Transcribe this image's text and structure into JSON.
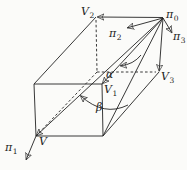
{
  "figure": {
    "type": "geometry-diagram",
    "background_color": "#fbfbf9",
    "stroke_color": "#222222",
    "labels": {
      "pi0": {
        "base": "π",
        "sub": "0"
      },
      "pi1": {
        "base": "π",
        "sub": "1"
      },
      "pi2": {
        "base": "π",
        "sub": "2"
      },
      "pi3": {
        "base": "π",
        "sub": "3"
      },
      "V": {
        "base": "V",
        "sub": ""
      },
      "V1": {
        "base": "V",
        "sub": "1"
      },
      "V2": {
        "base": "V",
        "sub": "2"
      },
      "V3": {
        "base": "V",
        "sub": "3"
      },
      "alpha": {
        "base": "α",
        "sub": ""
      },
      "beta": {
        "base": "β",
        "sub": ""
      }
    }
  }
}
